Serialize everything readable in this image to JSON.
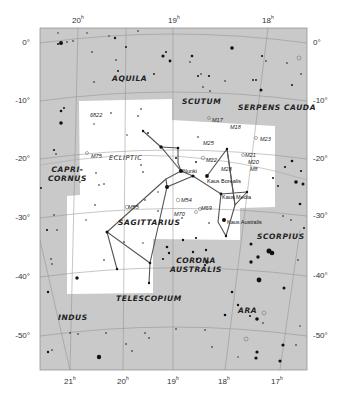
{
  "map": {
    "colors": {
      "background": "#ffffff",
      "outside": "#c8c8c8",
      "constellation": "#ffffff",
      "grid": "#8a8a8a",
      "stick": "#555555",
      "star": "#111111"
    },
    "ra_labels_top": [
      {
        "text": "20",
        "sup": "h",
        "x": 72,
        "y": 14
      },
      {
        "text": "19",
        "sup": "h",
        "x": 168,
        "y": 14
      },
      {
        "text": "18",
        "sup": "h",
        "x": 262,
        "y": 14
      }
    ],
    "ra_labels_bottom": [
      {
        "text": "21",
        "sup": "h",
        "x": 64,
        "y": 375
      },
      {
        "text": "20",
        "sup": "h",
        "x": 117,
        "y": 375
      },
      {
        "text": "19",
        "sup": "h",
        "x": 167,
        "y": 375
      },
      {
        "text": "18",
        "sup": "h",
        "x": 218,
        "y": 375
      },
      {
        "text": "17",
        "sup": "h",
        "x": 271,
        "y": 375
      }
    ],
    "dec_labels_left": [
      {
        "text": "0°",
        "y": 38
      },
      {
        "text": "-10°",
        "y": 96
      },
      {
        "text": "-20°",
        "y": 154
      },
      {
        "text": "-30°",
        "y": 213
      },
      {
        "text": "-40°",
        "y": 272
      },
      {
        "text": "-50°",
        "y": 331
      }
    ],
    "dec_labels_right": [
      {
        "text": "0°",
        "y": 38
      },
      {
        "text": "-10°",
        "y": 96
      },
      {
        "text": "-20°",
        "y": 154
      },
      {
        "text": "-30°",
        "y": 211
      },
      {
        "text": "-40°",
        "y": 271
      },
      {
        "text": "-50°",
        "y": 331
      }
    ],
    "constellations": [
      {
        "name": "AQUILA",
        "x": 112,
        "y": 74
      },
      {
        "name": "SCUTUM",
        "x": 182,
        "y": 97
      },
      {
        "name": "SERPENS CAUDA",
        "x": 238,
        "y": 103
      },
      {
        "name": "CAPRI-\nCORNUS",
        "x": 48,
        "y": 165
      },
      {
        "name": "ECLIPTIC",
        "x": 109,
        "y": 154
      },
      {
        "name": "SAGITTARIUS",
        "x": 118,
        "y": 218
      },
      {
        "name": "SCORPIUS",
        "x": 257,
        "y": 232
      },
      {
        "name": "CORONA\nAUSTRALIS",
        "x": 170,
        "y": 256
      },
      {
        "name": "TELESCOPIUM",
        "x": 116,
        "y": 294
      },
      {
        "name": "INDUS",
        "x": 58,
        "y": 313
      },
      {
        "name": "ARA",
        "x": 238,
        "y": 306
      }
    ],
    "deep_sky_objects": [
      {
        "label": "6822",
        "x": 90,
        "y": 112
      },
      {
        "label": "M75",
        "x": 91,
        "y": 153
      },
      {
        "label": "M17",
        "x": 212,
        "y": 117
      },
      {
        "label": "M18",
        "x": 230,
        "y": 124
      },
      {
        "label": "M25",
        "x": 203,
        "y": 140
      },
      {
        "label": "M23",
        "x": 260,
        "y": 136
      },
      {
        "label": "M22",
        "x": 206,
        "y": 157
      },
      {
        "label": "M21",
        "x": 245,
        "y": 152
      },
      {
        "label": "M20",
        "x": 248,
        "y": 159
      },
      {
        "label": "M8",
        "x": 250,
        "y": 166
      },
      {
        "label": "M28",
        "x": 221,
        "y": 166
      },
      {
        "label": "M55",
        "x": 128,
        "y": 204
      },
      {
        "label": "M54",
        "x": 179,
        "y": 199
      },
      {
        "label": "M70",
        "x": 174,
        "y": 211
      },
      {
        "label": "M69",
        "x": 201,
        "y": 206
      }
    ],
    "named_stars": [
      {
        "name": "Nunki",
        "x": 181,
        "y": 171
      },
      {
        "name": "Kaus Borealis",
        "x": 207,
        "y": 176
      },
      {
        "name": "Kaus Media",
        "x": 221,
        "y": 195
      },
      {
        "name": "Kaus Australis",
        "x": 218,
        "y": 222
      }
    ]
  }
}
